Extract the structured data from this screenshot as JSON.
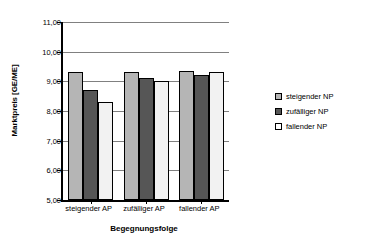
{
  "chart_data": {
    "type": "bar",
    "title": "",
    "xlabel": "Begegnungsfolge",
    "ylabel": "Marktpreis [GE/ME]",
    "categories": [
      "steigender AP",
      "zufälliger AP",
      "fallender AP"
    ],
    "series": [
      {
        "name": "steigender NP",
        "color": "#b5b5b5",
        "values": [
          9.3,
          9.3,
          9.35
        ]
      },
      {
        "name": "zufälliger NP",
        "color": "#565656",
        "values": [
          8.7,
          9.1,
          9.2
        ]
      },
      {
        "name": "fallender NP",
        "color": "#f2f2f2",
        "values": [
          8.3,
          9.0,
          9.3
        ]
      }
    ],
    "ylim": [
      5.0,
      11.0
    ],
    "ytick_values": [
      5.0,
      6.0,
      7.0,
      8.0,
      9.0,
      10.0,
      11.0
    ],
    "ytick_labels": [
      "5,00",
      "6,00",
      "7,00",
      "8,00",
      "9,00",
      "10,00",
      "11,00"
    ],
    "grid": true,
    "legend_position": "right"
  },
  "legend": {
    "items": [
      {
        "label": "steigender NP"
      },
      {
        "label": "zufälliger NP"
      },
      {
        "label": "fallender NP"
      }
    ]
  }
}
